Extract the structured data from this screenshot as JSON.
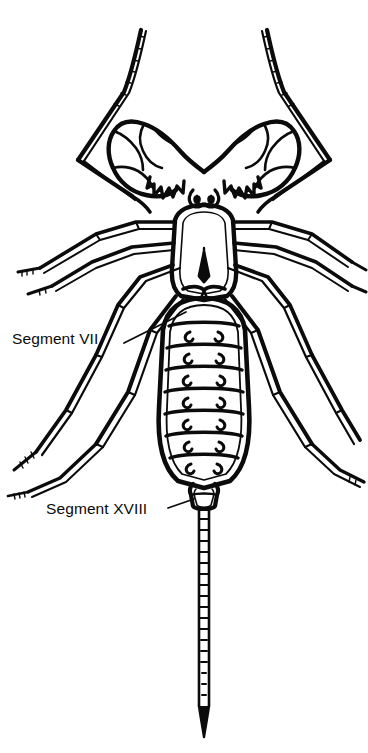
{
  "figure": {
    "background_color": "#ffffff",
    "ink_color": "#0b0b0b",
    "width": 368,
    "height": 753
  },
  "callouts": [
    {
      "id": "segment-vii",
      "label": "Segment VII",
      "label_x": 12,
      "label_y": 331,
      "leader_line": {
        "x1": 124,
        "y1": 343,
        "x2": 186,
        "y2": 312
      }
    },
    {
      "id": "segment-xviii",
      "label": "Segment XVIII",
      "label_x": 46,
      "label_y": 501,
      "leader_line": {
        "x1": 168,
        "y1": 508,
        "x2": 194,
        "y2": 499
      }
    }
  ],
  "anatomy": {
    "parts": [
      "antenniform-first-legs",
      "pedipalps",
      "chelicerae",
      "median-eyes",
      "carapace",
      "walking-legs",
      "opisthosoma-tergites",
      "pygidium",
      "flagellum"
    ],
    "tergite_count": 7,
    "tergite_marking": "paired-crescent-spots"
  }
}
